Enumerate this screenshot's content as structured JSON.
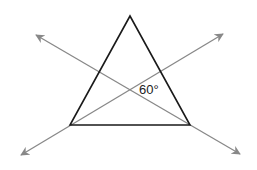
{
  "diagram": {
    "type": "geometry",
    "triangle": {
      "apex": [
        130,
        16
      ],
      "bottom_left": [
        70,
        125
      ],
      "bottom_right": [
        190,
        125
      ],
      "stroke": "#1a1a1a"
    },
    "lines": [
      {
        "name": "line-through-bottom-left",
        "from": [
          21,
          155
        ],
        "to": [
          223,
          34
        ],
        "stroke": "#888888"
      },
      {
        "name": "line-through-bottom-right",
        "from": [
          36,
          35
        ],
        "to": [
          240,
          154
        ],
        "stroke": "#888888"
      }
    ],
    "intersection": [
      130,
      88
    ],
    "angle_label": "60°",
    "angle_label_position": [
      139,
      94
    ]
  }
}
